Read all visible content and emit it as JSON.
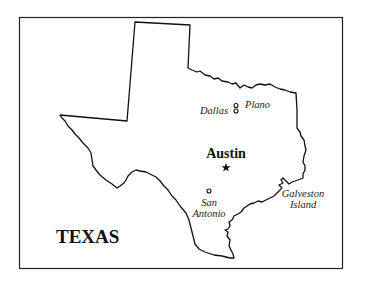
{
  "map": {
    "title": "TEXAS",
    "capital": {
      "name": "Austin",
      "marker": "star-icon"
    },
    "cities": [
      {
        "id": "dallas",
        "name": "Dallas",
        "marker": "circle-icon"
      },
      {
        "id": "plano",
        "name": "Plano",
        "marker": "circle-icon"
      },
      {
        "id": "san-antonio",
        "name_line1": "San",
        "name_line2": "Antonio",
        "marker": "circle-icon"
      }
    ],
    "features": [
      {
        "id": "galveston-island",
        "name_line1": "Galveston",
        "name_line2": "Island"
      }
    ],
    "colors": {
      "outline": "#111111",
      "background": "#ffffff"
    }
  }
}
